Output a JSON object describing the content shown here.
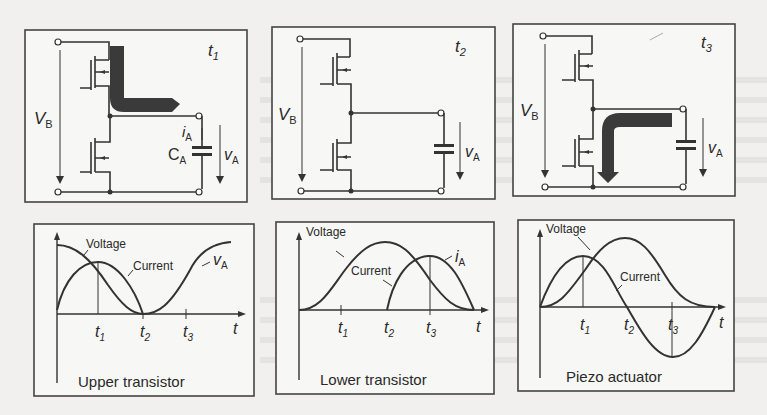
{
  "panels": {
    "circuits": [
      {
        "time_label": "t",
        "time_sub": "1",
        "vb": "V",
        "vb_sub": "B",
        "va": "v",
        "va_sub": "A",
        "ia": "i",
        "ia_sub": "A",
        "ca": "C",
        "ca_sub": "A",
        "arrow": "upper transistor to load"
      },
      {
        "time_label": "t",
        "time_sub": "2",
        "vb": "V",
        "vb_sub": "B",
        "va": "v",
        "va_sub": "A"
      },
      {
        "time_label": "t",
        "time_sub": "3",
        "vb": "V",
        "vb_sub": "B",
        "va": "v",
        "va_sub": "A",
        "arrow": "load to lower transistor"
      }
    ],
    "plots": [
      {
        "caption": "Upper transistor",
        "voltage_label": "Voltage",
        "current_label": "Current",
        "extra_label": "v",
        "extra_sub": "A",
        "ticks": [
          {
            "t": "t",
            "s": "1"
          },
          {
            "t": "t",
            "s": "2"
          },
          {
            "t": "t",
            "s": "3"
          }
        ],
        "axis_t": "t"
      },
      {
        "caption": "Lower transistor",
        "voltage_label": "Voltage",
        "current_label": "Current",
        "extra_label": "i",
        "extra_sub": "A",
        "ticks": [
          {
            "t": "t",
            "s": "1"
          },
          {
            "t": "t",
            "s": "2"
          },
          {
            "t": "t",
            "s": "3"
          }
        ],
        "axis_t": "t"
      },
      {
        "caption": "Piezo actuator",
        "voltage_label": "Voltage",
        "current_label": "Current",
        "ticks": [
          {
            "t": "t",
            "s": "1"
          },
          {
            "t": "t",
            "s": "2"
          },
          {
            "t": "t",
            "s": "3"
          }
        ],
        "axis_t": "t"
      }
    ]
  }
}
